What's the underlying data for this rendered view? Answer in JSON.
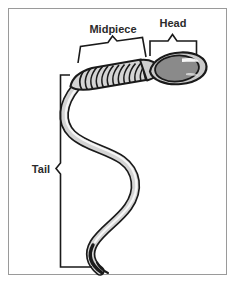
{
  "figure": {
    "background_color": "#ffffff",
    "border_color": "#9a9a9a"
  },
  "labels": {
    "midpiece": "Midpiece",
    "head": "Head",
    "tail": "Tail"
  },
  "colors": {
    "outline": "#1a1a1a",
    "body_fill": "#d4d4d4",
    "body_highlight": "#f2f2f2",
    "head_membrane": "#c9c9c9",
    "nucleus_fill": "#8a8a8a",
    "nucleus_highlight": "#ffffff",
    "brace_stroke": "#1a1a1a",
    "label_text": "#2b2b2b"
  },
  "structure": {
    "parts": [
      {
        "name": "head",
        "label": "Head",
        "description": "Oval head containing darker nucleus with acrosomal highlight"
      },
      {
        "name": "midpiece",
        "label": "Midpiece",
        "description": "Banded mitochondrial spiral region behind the head"
      },
      {
        "name": "tail",
        "label": "Tail",
        "description": "Long S-curved flagellum tapering to a fine point"
      }
    ],
    "midpiece_band_count": 13
  },
  "annotations": {
    "midpiece_brace": {
      "orientation": "angled-top",
      "points_to": "midpiece"
    },
    "head_brace": {
      "orientation": "horizontal-top",
      "points_to": "head"
    },
    "tail_bracket": {
      "orientation": "vertical-left",
      "points_to": "tail"
    }
  }
}
